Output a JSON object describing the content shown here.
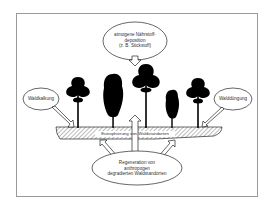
{
  "diagram": {
    "frame": {
      "border_color": "#9a9a9a",
      "background": "#ffffff"
    },
    "colors": {
      "ink": "#000000",
      "hatch": "#555555",
      "text": "#333333"
    },
    "top_ellipse": {
      "lines": [
        "atmogene Nährstoff-",
        "deposition",
        "(z. B. Stickstoff)"
      ]
    },
    "left_ellipse": {
      "label": "Waldkalkung"
    },
    "right_ellipse": {
      "label": "Walddüngung"
    },
    "ground_label": "Eutrophierung von Waldstandorten",
    "bottom_ellipse": {
      "lines": [
        "Regeneration von",
        "anthropogen",
        "degradierten Waldstandorten"
      ]
    },
    "trees": [
      {
        "type": "broad-crown",
        "x": 78
      },
      {
        "type": "columnar",
        "x": 113
      },
      {
        "type": "broad-crown",
        "x": 146
      },
      {
        "type": "columnar-small",
        "x": 172
      },
      {
        "type": "broad-crown",
        "x": 198
      }
    ]
  }
}
